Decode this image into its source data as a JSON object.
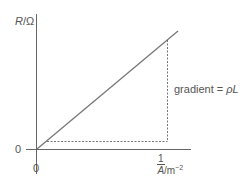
{
  "diagram": {
    "type": "graph",
    "y_axis": {
      "symbol": "R",
      "separator": "/",
      "unit": "Ω"
    },
    "x_axis": {
      "fraction_numerator": "1",
      "fraction_denominator": "A",
      "unit_prefix": " /m",
      "unit_exponent": "−2"
    },
    "origin_labels": {
      "y_zero": "0",
      "x_zero": "0"
    },
    "gradient_label": {
      "text": "gradient = ",
      "symbol": "ρL"
    },
    "colors": {
      "axis": "#666666",
      "line": "#777777",
      "dashed": "#666666",
      "text": "#555555"
    }
  }
}
